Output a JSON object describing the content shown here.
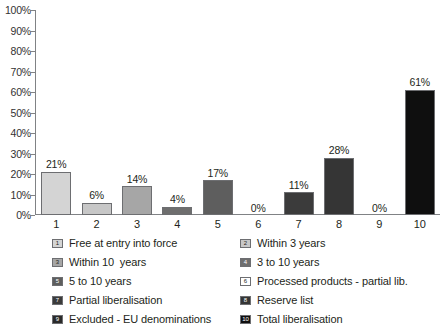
{
  "chart_data": {
    "type": "bar",
    "title": "",
    "subtitle": "",
    "xlabel": "",
    "ylabel": "",
    "ylim": [
      0,
      100
    ],
    "grid": false,
    "legend_position": "bottom",
    "categories": [
      "1",
      "2",
      "3",
      "4",
      "5",
      "6",
      "7",
      "8",
      "9",
      "10"
    ],
    "values": [
      21,
      6,
      14,
      4,
      17,
      0,
      11,
      28,
      0,
      61
    ],
    "value_labels": [
      "21%",
      "6%",
      "14%",
      "4%",
      "17%",
      "0%",
      "11%",
      "28%",
      "0%",
      "61%"
    ],
    "y_ticks": [
      0,
      10,
      20,
      30,
      40,
      50,
      60,
      70,
      80,
      90,
      100
    ],
    "y_tick_labels": [
      "0%",
      "10%",
      "20%",
      "30%",
      "40%",
      "50%",
      "60%",
      "70%",
      "80%",
      "90%",
      "100%"
    ],
    "series": [
      {
        "name": "Liberalisation categories",
        "values": [
          21,
          6,
          14,
          4,
          17,
          0,
          11,
          28,
          0,
          61
        ]
      }
    ],
    "bar_colors": [
      "#d4d4d4",
      "#c7c7c7",
      "#a6a6a6",
      "#6e6e6e",
      "#5e5e5e",
      "#ffffff",
      "#3b3b3b",
      "#353535",
      "#ffffff",
      "#0f0f0f"
    ],
    "bar_border_color": "#6d6e71",
    "axis_color": "#808285",
    "text_color": "#231f20"
  },
  "legend": {
    "left_column": [
      {
        "key": "1",
        "label": "Free at entry into force",
        "swatch": "#d4d4d4",
        "swatch_text_color": "#231f20"
      },
      {
        "key": "3",
        "label": "Within 10  years",
        "swatch": "#a6a6a6",
        "swatch_text_color": "#231f20"
      },
      {
        "key": "5",
        "label": "5 to 10 years",
        "swatch": "#5e5e5e",
        "swatch_text_color": "#ffffff"
      },
      {
        "key": "7",
        "label": "Partial liberalisation",
        "swatch": "#3b3b3b",
        "swatch_text_color": "#ffffff"
      },
      {
        "key": "9",
        "label": "Excluded - EU denominations",
        "swatch": "#2a2a2a",
        "swatch_text_color": "#ffffff"
      }
    ],
    "right_column": [
      {
        "key": "2",
        "label": "Within 3 years",
        "swatch": "#c7c7c7",
        "swatch_text_color": "#231f20"
      },
      {
        "key": "4",
        "label": "3 to 10 years",
        "swatch": "#6e6e6e",
        "swatch_text_color": "#ffffff"
      },
      {
        "key": "6",
        "label": "Processed products - partial lib.",
        "swatch": "#ffffff",
        "swatch_text_color": "#231f20"
      },
      {
        "key": "8",
        "label": "Reserve list",
        "swatch": "#353535",
        "swatch_text_color": "#ffffff"
      },
      {
        "key": "10",
        "label": "Total liberalisation",
        "swatch": "#0f0f0f",
        "swatch_text_color": "#ffffff"
      }
    ]
  }
}
